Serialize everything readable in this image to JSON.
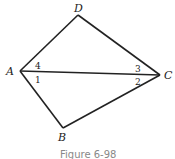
{
  "figure": {
    "caption": "Figure 6-98",
    "points": {
      "A": {
        "label": "A",
        "x": 20,
        "y": 71
      },
      "B": {
        "label": "B",
        "x": 63,
        "y": 128
      },
      "C": {
        "label": "C",
        "x": 160,
        "y": 75
      },
      "D": {
        "label": "D",
        "x": 78,
        "y": 15
      }
    },
    "segments": [
      "AD",
      "DC",
      "AC",
      "AB",
      "BC"
    ],
    "angles": {
      "a1": "1",
      "a2": "2",
      "a3": "3",
      "a4": "4"
    },
    "stroke_color": "#222222"
  }
}
